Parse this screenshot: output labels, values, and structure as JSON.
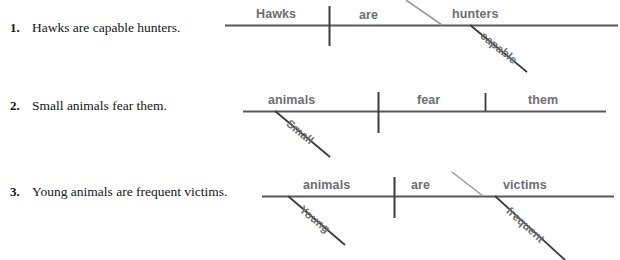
{
  "exercise": {
    "items": [
      {
        "number": "1.",
        "sentence": "Hawks are capable hunters.",
        "diagram": {
          "subject": "Hawks",
          "verb": "are",
          "complement": "hunters",
          "modifiers": [
            {
              "word": "capable",
              "attaches_to": "hunters"
            }
          ],
          "separator_type": "slanted-line-for-subject-complement"
        }
      },
      {
        "number": "2.",
        "sentence": "Small animals fear them.",
        "diagram": {
          "subject": "animals",
          "verb": "fear",
          "complement": "them",
          "modifiers": [
            {
              "word": "Small",
              "attaches_to": "animals"
            }
          ],
          "separator_type": "vertical-line-for-direct-object"
        }
      },
      {
        "number": "3.",
        "sentence": "Young animals are frequent victims.",
        "diagram": {
          "subject": "animals",
          "verb": "are",
          "complement": "victims",
          "modifiers": [
            {
              "word": "Young",
              "attaches_to": "animals"
            },
            {
              "word": "frequent",
              "attaches_to": "victims"
            }
          ],
          "separator_type": "slanted-line-for-subject-complement"
        }
      }
    ]
  },
  "style": {
    "baseline_color": "#58585c",
    "label_color": "#6e6e72",
    "sentence_color": "#16161a",
    "thin_line_color": "#9a9a9e"
  }
}
